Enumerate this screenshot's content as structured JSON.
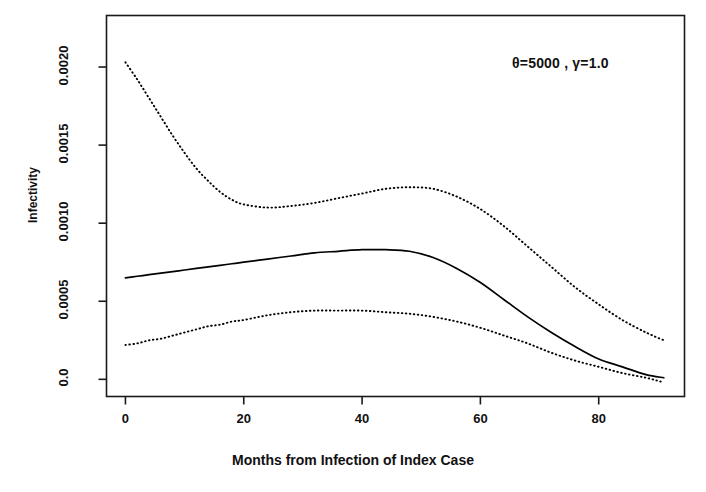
{
  "chart_data": {
    "type": "line",
    "title": "",
    "subtitle": "",
    "xlabel": "Months from Infection of Index Case",
    "ylabel": "Infectivity",
    "xlim": [
      -3.2,
      94.5
    ],
    "ylim": [
      -0.00011,
      0.00233
    ],
    "grid": false,
    "legend_position": "none",
    "xticks": [
      0,
      20,
      40,
      60,
      80
    ],
    "xtick_labels": [
      "0",
      "20",
      "40",
      "60",
      "80"
    ],
    "yticks": [
      0.0,
      0.0005,
      0.001,
      0.0015,
      0.002
    ],
    "ytick_labels": [
      "0.0",
      "0.0005",
      "0.0010",
      "0.0015",
      "0.0020"
    ],
    "annotations": [
      {
        "name": "parameter-annotation",
        "text": "θ=5000 , γ=1.0",
        "x": 72,
        "y": 0.00196
      }
    ],
    "x": [
      0,
      2,
      4,
      6,
      8,
      10,
      12,
      14,
      16,
      18,
      20,
      24,
      28,
      32,
      36,
      40,
      44,
      48,
      52,
      56,
      60,
      64,
      68,
      72,
      76,
      80,
      84,
      88,
      91
    ],
    "series": [
      {
        "name": "upper-confidence-band",
        "style": "dotted",
        "color": "#000000",
        "values": [
          0.00203,
          0.00192,
          0.0018,
          0.00168,
          0.00156,
          0.00145,
          0.00135,
          0.00127,
          0.0012,
          0.00115,
          0.00112,
          0.0011,
          0.00111,
          0.00113,
          0.00116,
          0.00119,
          0.00122,
          0.00123,
          0.00122,
          0.00117,
          0.00109,
          0.00098,
          0.00085,
          0.00072,
          0.00059,
          0.00048,
          0.00038,
          0.0003,
          0.00025
        ]
      },
      {
        "name": "fitted-infectivity",
        "style": "solid",
        "color": "#000000",
        "values": [
          0.00065,
          0.00066,
          0.00067,
          0.00068,
          0.00069,
          0.0007,
          0.00071,
          0.00072,
          0.00073,
          0.00074,
          0.00075,
          0.00077,
          0.00079,
          0.00081,
          0.00082,
          0.00083,
          0.00083,
          0.00082,
          0.00078,
          0.00071,
          0.00062,
          0.00051,
          0.0004,
          0.0003,
          0.00021,
          0.00013,
          8e-05,
          3e-05,
          1e-05
        ]
      },
      {
        "name": "lower-confidence-band",
        "style": "dotted",
        "color": "#000000",
        "values": [
          0.00022,
          0.00023,
          0.00025,
          0.00026,
          0.00028,
          0.0003,
          0.00032,
          0.00034,
          0.00035,
          0.00037,
          0.00038,
          0.00041,
          0.00043,
          0.00044,
          0.00044,
          0.00044,
          0.00043,
          0.00042,
          0.0004,
          0.00037,
          0.00033,
          0.00028,
          0.00023,
          0.00017,
          0.00012,
          8e-05,
          4e-05,
          1e-05,
          -2e-05
        ]
      }
    ]
  },
  "axis": {
    "y_title": "Infectivity",
    "x_title": "Months from Infection of Index Case"
  }
}
